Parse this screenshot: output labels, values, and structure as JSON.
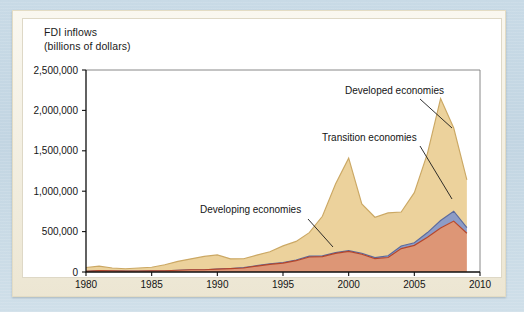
{
  "figure": {
    "axis_title": "FDI inflows\n(billions of dollars)"
  },
  "chart_data": {
    "type": "area",
    "stacked": true,
    "title": "FDI inflows (billions of dollars)",
    "xlabel": "",
    "ylabel": "FDI inflows (billions of dollars)",
    "xlim": [
      1980,
      2010
    ],
    "ylim": [
      0,
      2500000
    ],
    "grid": false,
    "legend_position": "annotations-on-plot",
    "xticks": [
      1980,
      1985,
      1990,
      1995,
      2000,
      2005,
      2010
    ],
    "xtick_labels": [
      "1980",
      "1985",
      "1990",
      "1995",
      "2000",
      "2005",
      "2010"
    ],
    "yticks": [
      0,
      500000,
      1000000,
      1500000,
      2000000,
      2500000
    ],
    "ytick_labels": [
      "0",
      "500,000",
      "1,000,000",
      "1,500,000",
      "2,000,000",
      "2,500,000"
    ],
    "x": [
      1980,
      1981,
      1982,
      1983,
      1984,
      1985,
      1986,
      1987,
      1988,
      1989,
      1990,
      1991,
      1992,
      1993,
      1994,
      1995,
      1996,
      1997,
      1998,
      1999,
      2000,
      2001,
      2002,
      2003,
      2004,
      2005,
      2006,
      2007,
      2008,
      2009
    ],
    "series": [
      {
        "name": "Developing economies",
        "color": "#dd9676",
        "line_color": "#b4452a",
        "values": [
          8400,
          17000,
          15000,
          10000,
          12000,
          14000,
          16000,
          22000,
          28000,
          28000,
          35000,
          41000,
          50000,
          73000,
          94000,
          110000,
          140000,
          185000,
          190000,
          230000,
          255000,
          220000,
          165000,
          180000,
          290000,
          330000,
          430000,
          545000,
          630000,
          480000
        ]
      },
      {
        "name": "Transition economies",
        "color": "#8d9cc6",
        "line_color": "#5b6a9c",
        "values": [
          0,
          0,
          0,
          0,
          0,
          0,
          0,
          0,
          0,
          0,
          1000,
          2000,
          4000,
          6000,
          6000,
          8000,
          9000,
          12000,
          10000,
          10000,
          9000,
          12000,
          13000,
          21000,
          32000,
          32000,
          58000,
          92000,
          122000,
          70000
        ]
      },
      {
        "name": "Developed economies",
        "color": "#ecd29c",
        "line_color": "#cba864",
        "values": [
          47000,
          55000,
          35000,
          30000,
          38000,
          45000,
          73000,
          110000,
          135000,
          165000,
          175000,
          120000,
          110000,
          130000,
          150000,
          205000,
          230000,
          290000,
          490000,
          850000,
          1145000,
          610000,
          500000,
          530000,
          420000,
          620000,
          980000,
          1510000,
          1030000,
          590000
        ]
      }
    ],
    "annotations": [
      {
        "text": "Developed economies",
        "x": 345,
        "y": 94,
        "anchor": "start",
        "leader": [
          [
            420,
            99
          ],
          [
            452,
            128
          ]
        ]
      },
      {
        "text": "Transition economies",
        "x": 322,
        "y": 141,
        "anchor": "start",
        "leader": [
          [
            420,
            146
          ],
          [
            452,
            199
          ]
        ]
      },
      {
        "text": "Developing economies",
        "x": 200,
        "y": 213,
        "anchor": "start",
        "leader": [
          [
            308,
            219
          ],
          [
            333,
            247
          ]
        ]
      }
    ]
  }
}
